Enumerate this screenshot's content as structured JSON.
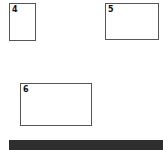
{
  "boxes": [
    {
      "id": "4",
      "label": "4"
    },
    {
      "id": "5",
      "label": "5"
    },
    {
      "id": "6",
      "label": "6"
    }
  ],
  "colors": {
    "border": "#555555",
    "bar": "#2e2e2e",
    "background": "#ffffff"
  }
}
